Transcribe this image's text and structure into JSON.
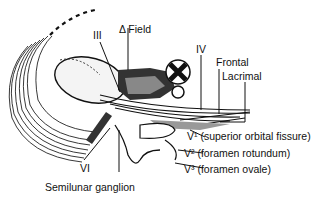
{
  "diagram": {
    "type": "anatomical illustration",
    "labels": {
      "iii": "III",
      "field": "Δ Field",
      "iv": "IV",
      "frontal": "Frontal",
      "lacrimal": "Lacrimal",
      "v1": "V¹ (superior orbital fissure)",
      "v2": "V² (foramen rotundum)",
      "v3": "V³ (foramen ovale)",
      "vi": "VI",
      "ganglion": "Semilunar ganglion"
    }
  }
}
